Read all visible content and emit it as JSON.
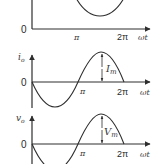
{
  "colors": {
    "stroke": "#2e2e2e",
    "text": "#2a2a2a",
    "background": "#ffffff"
  },
  "plots": [
    {
      "name": "top-plot",
      "origin_label": "0",
      "y_label": "",
      "x_ticks": [
        "π",
        "2π"
      ],
      "x_label": "ωt"
    },
    {
      "name": "current-plot",
      "origin_label": "0",
      "y_label": "i",
      "y_label_sub": "o",
      "x_ticks": [
        "π",
        "2π"
      ],
      "x_label": "ωt",
      "amplitude_label": "I",
      "amplitude_sub": "m"
    },
    {
      "name": "voltage-plot",
      "origin_label": "0",
      "y_label": "v",
      "y_label_sub": "o",
      "x_ticks": [
        "π",
        "2π"
      ],
      "x_label": "ωt",
      "amplitude_label": "V",
      "amplitude_sub": "m"
    }
  ]
}
